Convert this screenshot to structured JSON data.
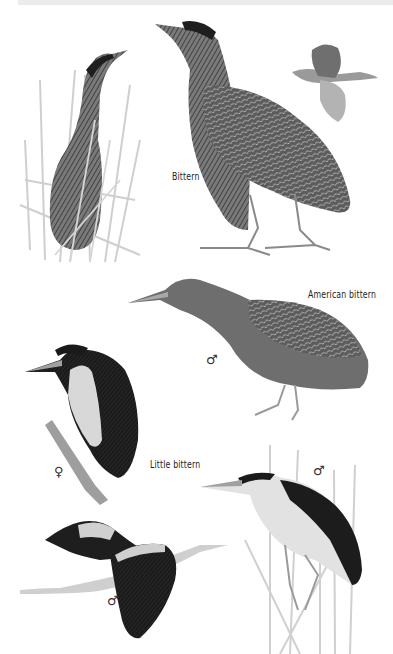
{
  "plate": {
    "header_text": "",
    "labels": {
      "bittern": "Bittern",
      "american_bittern": "American bittern",
      "little_bittern": "Little bittern"
    },
    "sex_symbols": {
      "american_bittern": "♂",
      "little_bittern_female": "♀",
      "little_bittern_male_perched": "♂",
      "little_bittern_male_flight": "♂"
    },
    "figures": [
      {
        "species": "Bittern",
        "pose": "hidden in reeds"
      },
      {
        "species": "Bittern",
        "pose": "standing"
      },
      {
        "species": "Bittern",
        "pose": "in flight"
      },
      {
        "species": "American bittern",
        "pose": "walking",
        "sex": "male"
      },
      {
        "species": "Little bittern",
        "pose": "perched on stem",
        "sex": "female"
      },
      {
        "species": "Little bittern",
        "pose": "in flight",
        "sex": "male"
      },
      {
        "species": "Little bittern",
        "pose": "clinging to reeds",
        "sex": "male"
      }
    ],
    "colors": {
      "background": "#ffffff",
      "ink_dark": "#1e1e1e",
      "ink_mid": "#6a6a6a",
      "ink_light": "#c8c8c8",
      "reed": "#cfcfcf"
    }
  }
}
